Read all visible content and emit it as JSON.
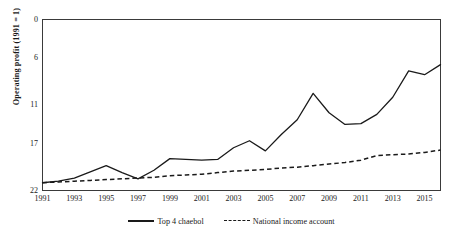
{
  "chart_data": {
    "type": "line",
    "title": "",
    "xlabel": "",
    "ylabel": "Operating profit (1991 = 1)",
    "x": [
      1991,
      1992,
      1993,
      1994,
      1995,
      1996,
      1997,
      1998,
      1999,
      2000,
      2001,
      2002,
      2003,
      2004,
      2005,
      2006,
      2007,
      2008,
      2009,
      2010,
      2011,
      2012,
      2013,
      2014,
      2015,
      2016
    ],
    "xlim": [
      1991,
      2016
    ],
    "ylim": [
      0,
      22
    ],
    "yticks": [
      0,
      6,
      11,
      17,
      22
    ],
    "xticks": [
      1991,
      1993,
      1995,
      1997,
      1999,
      2001,
      2003,
      2005,
      2007,
      2009,
      2011,
      2013,
      2015
    ],
    "grid": false,
    "legend_position": "bottom",
    "series": [
      {
        "name": "Top 4 chaebol",
        "style": "solid",
        "color": "#1a1a1a",
        "values": [
          1.0,
          1.2,
          1.6,
          2.4,
          3.2,
          2.3,
          1.5,
          2.6,
          4.1,
          4.0,
          3.9,
          4.0,
          5.5,
          6.4,
          5.1,
          7.2,
          9.1,
          12.5,
          10.0,
          8.5,
          8.6,
          9.8,
          12.0,
          15.4,
          14.9,
          16.2
        ]
      },
      {
        "name": "National income account",
        "style": "dashed",
        "color": "#1a1a1a",
        "values": [
          1.0,
          1.1,
          1.2,
          1.3,
          1.4,
          1.5,
          1.6,
          1.7,
          1.9,
          2.0,
          2.1,
          2.3,
          2.5,
          2.6,
          2.7,
          2.9,
          3.0,
          3.2,
          3.4,
          3.6,
          3.9,
          4.5,
          4.6,
          4.7,
          4.9,
          5.2
        ]
      }
    ]
  },
  "axis": {
    "y_title": "Operating profit (1991 = 1)",
    "y_ticks": [
      "22",
      "17",
      "11",
      "6",
      "0"
    ],
    "x_ticks": [
      "1991",
      "1993",
      "1995",
      "1997",
      "1999",
      "2001",
      "2003",
      "2005",
      "2007",
      "2009",
      "2011",
      "2013",
      "2015"
    ]
  },
  "legend": {
    "items": [
      {
        "label": "Top 4 chaebol",
        "style": "solid"
      },
      {
        "label": "National income account",
        "style": "dashed"
      }
    ]
  }
}
